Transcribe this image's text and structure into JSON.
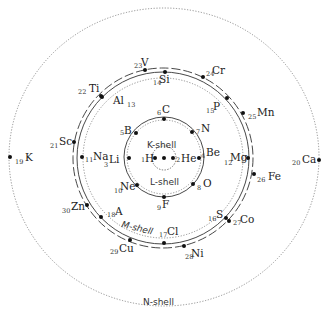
{
  "shells": {
    "k": {
      "label": "K-shell"
    },
    "l": {
      "label": "L-shell"
    },
    "m": {
      "label": "M-shell"
    },
    "n": {
      "label": "N-shell"
    }
  },
  "elements": [
    {
      "z": "1",
      "symbol": "H"
    },
    {
      "z": "2",
      "symbol": "He"
    },
    {
      "z": "3",
      "symbol": "Li"
    },
    {
      "z": "4",
      "symbol": "Be"
    },
    {
      "z": "5",
      "symbol": "B"
    },
    {
      "z": "6",
      "symbol": "C"
    },
    {
      "z": "7",
      "symbol": "N"
    },
    {
      "z": "8",
      "symbol": "O"
    },
    {
      "z": "9",
      "symbol": "F"
    },
    {
      "z": "10",
      "symbol": "Ne"
    },
    {
      "z": "11",
      "symbol": "Na"
    },
    {
      "z": "12",
      "symbol": "Mg"
    },
    {
      "z": "13",
      "symbol": "Al"
    },
    {
      "z": "14",
      "symbol": "Si"
    },
    {
      "z": "15",
      "symbol": "P"
    },
    {
      "z": "16",
      "symbol": "S"
    },
    {
      "z": "17",
      "symbol": "Cl"
    },
    {
      "z": "18",
      "symbol": "A"
    },
    {
      "z": "19",
      "symbol": "K"
    },
    {
      "z": "20",
      "symbol": "Ca"
    },
    {
      "z": "21",
      "symbol": "Sc"
    },
    {
      "z": "22",
      "symbol": "Ti"
    },
    {
      "z": "23",
      "symbol": "V"
    },
    {
      "z": "24",
      "symbol": "Cr"
    },
    {
      "z": "25",
      "symbol": "Mn"
    },
    {
      "z": "26",
      "symbol": "Fe"
    },
    {
      "z": "27",
      "symbol": "Co"
    },
    {
      "z": "28",
      "symbol": "Ni"
    },
    {
      "z": "29",
      "symbol": "Cu"
    },
    {
      "z": "30",
      "symbol": "Zn"
    }
  ]
}
